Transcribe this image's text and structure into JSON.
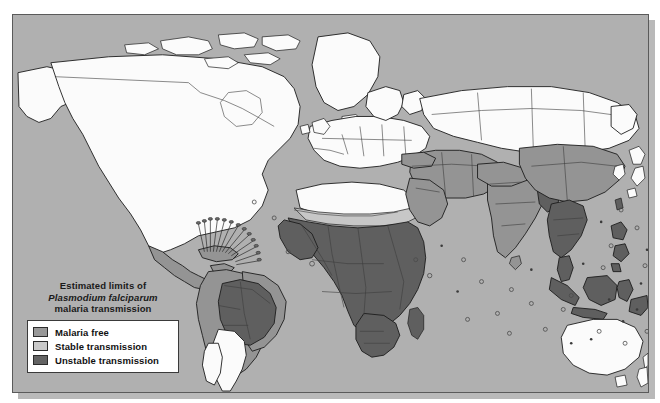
{
  "map": {
    "name": "world-malaria-transmission-map",
    "projection": "world-equirectangular",
    "background_color": "#b0b0b0",
    "border_color": "#5a5a5a",
    "shadow_color": "#b9b9b9"
  },
  "legend": {
    "title_lines": [
      "Estimated limits of",
      "Plasmodium falciparum",
      "malaria transmission"
    ],
    "title_line_1": "Estimated limits of",
    "title_line_2": "Plasmodium falciparum",
    "title_line_3": "malaria transmission",
    "items": [
      {
        "label": "Malaria free",
        "color": "#989898",
        "key": "malaria-free"
      },
      {
        "label": "Stable transmission",
        "color": "#c9c9c9",
        "key": "stable-transmission"
      },
      {
        "label": "Unstable transmission",
        "color": "#636363",
        "key": "unstable-transmission"
      }
    ]
  },
  "classes": {
    "ocean": "#b0b0b0",
    "malaria_free": "#fbfbfb",
    "unstable": "#949494",
    "stable": "#5f5f5f",
    "sahel_fringe": "#c7c7c7",
    "coastline": "#1c1c1c",
    "internal_border": "#3c3c3c"
  },
  "regions": [
    {
      "name": "North America",
      "class": "malaria_free"
    },
    {
      "name": "Greenland",
      "class": "malaria_free"
    },
    {
      "name": "Europe",
      "class": "malaria_free"
    },
    {
      "name": "Russia",
      "class": "malaria_free"
    },
    {
      "name": "Australia",
      "class": "malaria_free"
    },
    {
      "name": "New Zealand",
      "class": "malaria_free"
    },
    {
      "name": "Southern Cone",
      "class": "malaria_free"
    },
    {
      "name": "North Africa",
      "class": "malaria_free"
    },
    {
      "name": "Sahel",
      "class": "sahel_fringe"
    },
    {
      "name": "Sub-Saharan Africa",
      "class": "stable"
    },
    {
      "name": "Amazon Basin",
      "class": "stable"
    },
    {
      "name": "Andean / Northern South America",
      "class": "unstable"
    },
    {
      "name": "Central America",
      "class": "unstable"
    },
    {
      "name": "Middle East",
      "class": "unstable"
    },
    {
      "name": "Central Asia",
      "class": "unstable"
    },
    {
      "name": "India",
      "class": "unstable"
    },
    {
      "name": "China",
      "class": "unstable"
    },
    {
      "name": "Southeast Asia",
      "class": "stable"
    },
    {
      "name": "Indonesia",
      "class": "stable"
    },
    {
      "name": "Papua New Guinea",
      "class": "stable"
    },
    {
      "name": "Philippines",
      "class": "stable"
    },
    {
      "name": "Madagascar",
      "class": "stable"
    }
  ]
}
